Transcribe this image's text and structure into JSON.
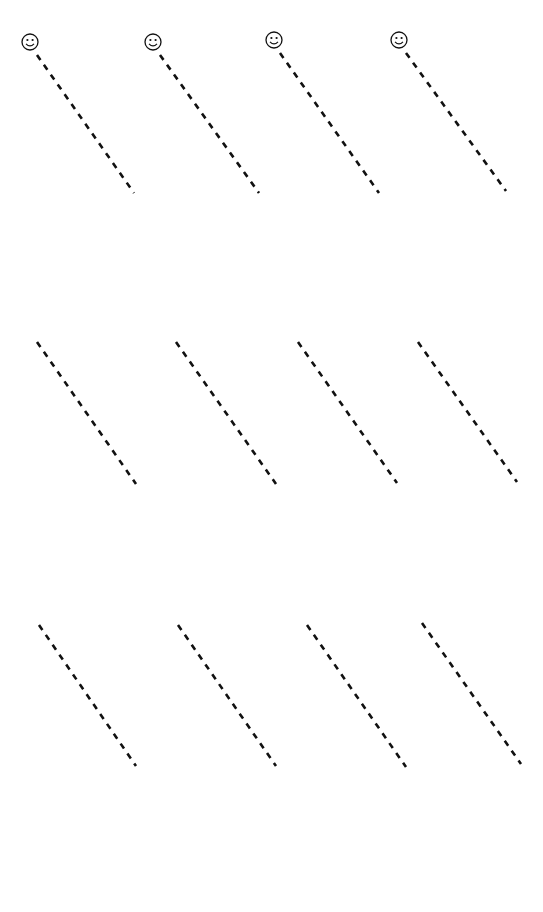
{
  "page": {
    "width": 543,
    "height": 912,
    "background": "#ffffff",
    "cutoff_title": ""
  },
  "style": {
    "stroke_color": "#111111",
    "stroke_width": 2.6,
    "dash_pattern": "6 6",
    "icon_radius": 8
  },
  "rows": [
    {
      "row_index": 1,
      "lines": [
        {
          "icon": "smiley-face-icon",
          "icon_center": [
            30,
            42
          ],
          "start": [
            37,
            55
          ],
          "end": [
            134,
            193
          ]
        },
        {
          "icon": "smiley-face-icon",
          "icon_center": [
            153,
            42
          ],
          "start": [
            160,
            55
          ],
          "end": [
            259,
            193
          ]
        },
        {
          "icon": "smiley-face-icon",
          "icon_center": [
            274,
            40
          ],
          "start": [
            280,
            53
          ],
          "end": [
            379,
            193
          ]
        },
        {
          "icon": "smiley-face-icon",
          "icon_center": [
            399,
            40
          ],
          "start": [
            406,
            53
          ],
          "end": [
            506,
            191
          ]
        }
      ]
    },
    {
      "row_index": 2,
      "lines": [
        {
          "icon": null,
          "start": [
            37,
            342
          ],
          "end": [
            136,
            484
          ]
        },
        {
          "icon": null,
          "start": [
            176,
            342
          ],
          "end": [
            276,
            484
          ]
        },
        {
          "icon": null,
          "start": [
            298,
            342
          ],
          "end": [
            397,
            483
          ]
        },
        {
          "icon": null,
          "start": [
            418,
            342
          ],
          "end": [
            517,
            482
          ]
        }
      ]
    },
    {
      "row_index": 3,
      "lines": [
        {
          "icon": null,
          "start": [
            39,
            625
          ],
          "end": [
            136,
            766
          ]
        },
        {
          "icon": null,
          "start": [
            178,
            625
          ],
          "end": [
            276,
            766
          ]
        },
        {
          "icon": null,
          "start": [
            307,
            625
          ],
          "end": [
            406,
            767
          ]
        },
        {
          "icon": null,
          "start": [
            422,
            623
          ],
          "end": [
            521,
            764
          ]
        }
      ]
    }
  ]
}
